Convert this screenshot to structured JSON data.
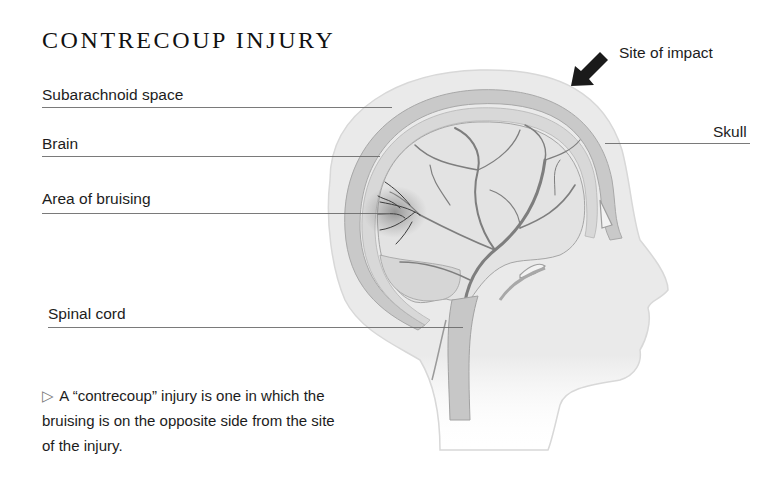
{
  "diagram": {
    "title": "CONTRECOUP INJURY",
    "labels": {
      "site_of_impact": "Site of impact",
      "skull": "Skull",
      "subarachnoid_space": "Subarachnoid space",
      "brain": "Brain",
      "area_of_bruising": "Area of bruising",
      "spinal_cord": "Spinal cord"
    },
    "caption": {
      "marker": "▷",
      "text": "A “contrecoup” injury is one in which the bruising is on the opposite side from the site of the injury."
    },
    "colors": {
      "leader_line": "#6b6b6b",
      "arrow": "#1a1a1a",
      "head_fill": "#e9e9e9",
      "skull": "#bdbdbd",
      "vessels": "#7a7a7a",
      "bruise": "#3a3a3a"
    }
  }
}
